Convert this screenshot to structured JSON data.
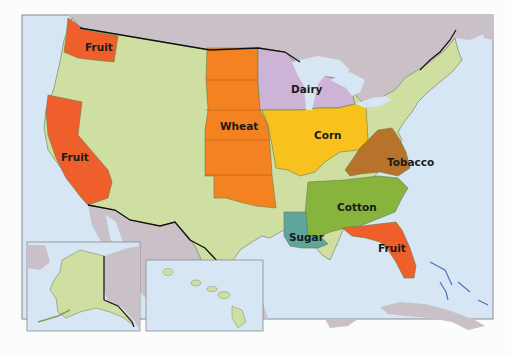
{
  "map": {
    "title": "U.S. Agricultural Regions",
    "colors": {
      "water": "#d7e6f4",
      "foreign": "#c9c0c8",
      "other_states": "#cfdfa2",
      "fruit": "#ef5f2c",
      "wheat": "#f58220",
      "dairy": "#cdb3d6",
      "corn": "#f7c21e",
      "tobacco": "#b8732a",
      "cotton": "#86b43c",
      "sugar": "#5ea59c",
      "frame": "#8a8a8a"
    },
    "regions": [
      {
        "name": "fruit-washington",
        "label": "Fruit"
      },
      {
        "name": "fruit-california",
        "label": "Fruit"
      },
      {
        "name": "wheat",
        "label": "Wheat"
      },
      {
        "name": "dairy",
        "label": "Dairy"
      },
      {
        "name": "corn",
        "label": "Corn"
      },
      {
        "name": "tobacco",
        "label": "Tobacco"
      },
      {
        "name": "cotton",
        "label": "Cotton"
      },
      {
        "name": "sugar",
        "label": "Sugar"
      },
      {
        "name": "fruit-florida",
        "label": "Fruit"
      }
    ],
    "insets": [
      {
        "name": "alaska-inset"
      },
      {
        "name": "hawaii-inset"
      }
    ]
  }
}
